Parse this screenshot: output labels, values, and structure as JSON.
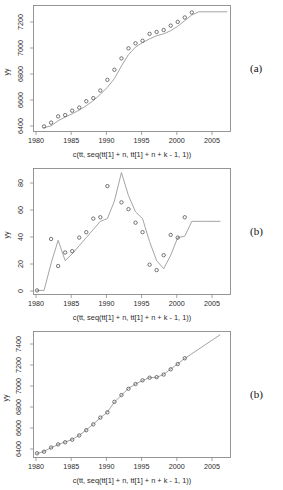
{
  "figure": {
    "panels": [
      {
        "letter": "(a)",
        "ylabel": "yy",
        "xlabel": "c(tt, seq(tt[1] + n, tt[1] + n + k - 1, 1))",
        "yticks": [
          "6400",
          "6600",
          "6800",
          "7000",
          "7200"
        ],
        "xticks": [
          "1980",
          "1985",
          "1990",
          "1995",
          "2000",
          "2005"
        ]
      },
      {
        "letter": "(b)",
        "ylabel": "yy",
        "xlabel": "c(tt, seq(tt[1] + n, tt[1] + n + k - 1, 1))",
        "yticks": [
          "0",
          "20",
          "40",
          "60",
          "80"
        ],
        "xticks": [
          "1980",
          "1985",
          "1990",
          "1995",
          "2000",
          "2005"
        ]
      },
      {
        "letter": "(b)",
        "ylabel": "yy",
        "xlabel": "c(tt, seq(tt[1] + n, tt[1] + n + k - 1, 1))",
        "yticks": [
          "6400",
          "6600",
          "6800",
          "7000",
          "7200",
          "7400"
        ],
        "xticks": [
          "1980",
          "1985",
          "1990",
          "1995",
          "2000",
          "2005"
        ]
      }
    ]
  },
  "chart_data": [
    {
      "type": "scatter",
      "title": "",
      "xlabel": "c(tt, seq(tt[1] + n, tt[1] + n + k - 1, 1))",
      "ylabel": "yy",
      "xlim": [
        1979.5,
        2007.5
      ],
      "ylim": [
        6300,
        7300
      ],
      "grid": false,
      "legend": "none",
      "series": [
        {
          "name": "observed",
          "marker": "open-circle",
          "x": [
            1981,
            1982,
            1983,
            1984,
            1985,
            1986,
            1987,
            1988,
            1989,
            1990,
            1991,
            1992,
            1993,
            1994,
            1995,
            1996,
            1997,
            1998,
            1999,
            2000,
            2001,
            2002
          ],
          "y": [
            6340,
            6370,
            6420,
            6430,
            6465,
            6490,
            6540,
            6565,
            6625,
            6710,
            6790,
            6880,
            6960,
            7000,
            7020,
            7075,
            7090,
            7105,
            7140,
            7170,
            7205,
            7245
          ]
        },
        {
          "name": "fitted-and-forecast",
          "marker": "none",
          "x": [
            1981,
            1982,
            1983,
            1984,
            1985,
            1986,
            1987,
            1988,
            1989,
            1990,
            1991,
            1992,
            1993,
            1994,
            1995,
            1996,
            1997,
            1998,
            1999,
            2000,
            2001,
            2002,
            2003,
            2004,
            2005,
            2006,
            2007
          ],
          "y": [
            6330,
            6345,
            6385,
            6415,
            6440,
            6470,
            6505,
            6545,
            6595,
            6650,
            6720,
            6820,
            6910,
            6970,
            7005,
            7035,
            7060,
            7075,
            7100,
            7135,
            7180,
            7225,
            7250,
            7250,
            7250,
            7250,
            7250
          ]
        }
      ]
    },
    {
      "type": "scatter",
      "title": "",
      "xlabel": "c(tt, seq(tt[1] + n, tt[1] + n + k - 1, 1))",
      "ylabel": "yy",
      "xlim": [
        1979.5,
        2007.5
      ],
      "ylim": [
        -3,
        90
      ],
      "grid": false,
      "legend": "none",
      "series": [
        {
          "name": "observed",
          "marker": "open-circle",
          "x": [
            1980,
            1982,
            1983,
            1984,
            1985,
            1986,
            1987,
            1988,
            1989,
            1990,
            1992,
            1993,
            1994,
            1995,
            1996,
            1997,
            1998,
            1999,
            2000,
            2001
          ],
          "y": [
            0,
            38,
            18,
            28,
            29,
            39,
            43,
            53,
            54,
            77,
            65,
            60,
            50,
            43,
            19,
            15,
            26,
            41,
            39,
            54
          ]
        },
        {
          "name": "fitted-and-forecast",
          "marker": "none",
          "x": [
            1980,
            1981,
            1982,
            1983,
            1984,
            1985,
            1986,
            1987,
            1988,
            1989,
            1990,
            1991,
            1992,
            1993,
            1994,
            1995,
            1996,
            1997,
            1998,
            1999,
            2000,
            2001,
            2002,
            2003,
            2004,
            2005,
            2006
          ],
          "y": [
            0,
            0,
            20,
            37,
            22,
            27,
            33,
            39,
            45,
            51,
            53,
            66,
            87,
            70,
            58,
            53,
            36,
            22,
            16,
            26,
            39,
            40,
            51,
            51,
            51,
            51,
            51
          ]
        }
      ]
    },
    {
      "type": "scatter",
      "title": "",
      "xlabel": "c(tt, seq(tt[1] + n, tt[1] + n + k - 1, 1))",
      "ylabel": "yy",
      "xlim": [
        1979.5,
        2007.5
      ],
      "ylim": [
        6300,
        7500
      ],
      "grid": false,
      "legend": "none",
      "series": [
        {
          "name": "observed",
          "marker": "open-circle",
          "x": [
            1980,
            1981,
            1982,
            1983,
            1984,
            1985,
            1986,
            1987,
            1988,
            1989,
            1990,
            1991,
            1992,
            1993,
            1994,
            1995,
            1996,
            1997,
            1998,
            1999,
            2000,
            2001
          ],
          "y": [
            6340,
            6355,
            6395,
            6425,
            6445,
            6470,
            6510,
            6560,
            6615,
            6680,
            6730,
            6830,
            6895,
            6955,
            7000,
            7035,
            7060,
            7065,
            7090,
            7140,
            7190,
            7245
          ]
        },
        {
          "name": "fitted-and-forecast",
          "marker": "none",
          "x": [
            1980,
            1981,
            1982,
            1983,
            1984,
            1985,
            1986,
            1987,
            1988,
            1989,
            1990,
            1991,
            1992,
            1993,
            1994,
            1995,
            1996,
            1997,
            1998,
            1999,
            2000,
            2001,
            2002,
            2003,
            2004,
            2005,
            2006
          ],
          "y": [
            6338,
            6358,
            6393,
            6423,
            6448,
            6472,
            6512,
            6562,
            6618,
            6678,
            6732,
            6828,
            6893,
            6958,
            7000,
            7032,
            7062,
            7062,
            7092,
            7142,
            7192,
            7243,
            7288,
            7333,
            7378,
            7423,
            7468
          ]
        }
      ]
    }
  ]
}
